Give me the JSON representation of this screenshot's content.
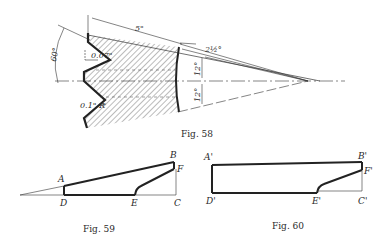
{
  "figures": [
    {
      "id": "fig58",
      "caption": "Fig. 58",
      "dimensions": {
        "length": "5\"",
        "thread_angle": "60°",
        "pitch_offset": "0.07\"",
        "root_radius": "0.1\" R",
        "small_angle": "2½°",
        "upper_angle": "12°",
        "lower_angle": "12°"
      }
    },
    {
      "id": "fig59",
      "caption": "Fig. 59",
      "points": [
        "A",
        "B",
        "C",
        "D",
        "E",
        "F"
      ]
    },
    {
      "id": "fig60",
      "caption": "Fig. 60",
      "points": [
        "A'",
        "B'",
        "C'",
        "D'",
        "E'",
        "F'"
      ]
    }
  ],
  "colors": {
    "ink": "#2a2a2a",
    "hatch": "#555555",
    "background": "#ffffff"
  }
}
